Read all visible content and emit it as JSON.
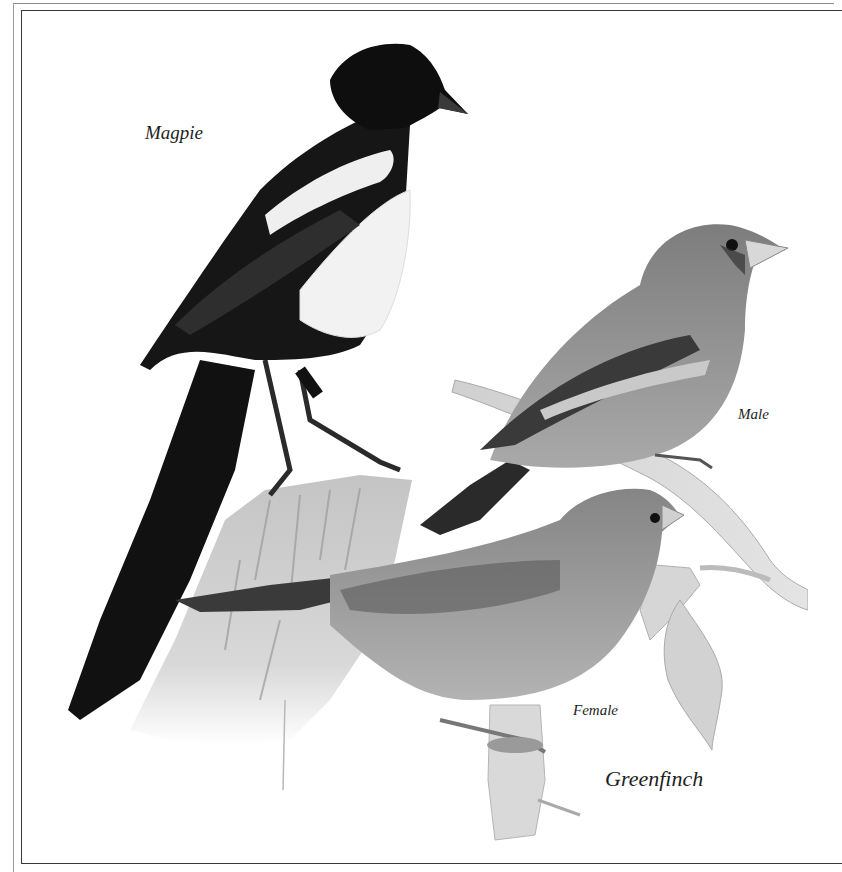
{
  "plate": {
    "labels": {
      "magpie": "Magpie",
      "male": "Male",
      "female": "Female",
      "greenfinch": "Greenfinch"
    },
    "subjects": [
      {
        "name": "Magpie",
        "pose": "perched on wooden post"
      },
      {
        "name": "Greenfinch",
        "sex": "Male",
        "pose": "perched on branch"
      },
      {
        "name": "Greenfinch",
        "sex": "Female",
        "pose": "perched on branch"
      }
    ],
    "colors": {
      "paper": "#ffffff",
      "ink": "#111111",
      "frame": "#3a3a3a",
      "finch_body": "#8c8c8c",
      "post": "#c8c8c8"
    }
  }
}
